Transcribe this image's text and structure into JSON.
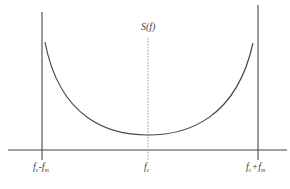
{
  "diagram": {
    "title_label": "S(f)",
    "axis_labels": {
      "left": {
        "base": "f",
        "sub1": "c",
        "op": "-",
        "base2": "f",
        "sub2": "m"
      },
      "center": {
        "base": "f",
        "sub": "c"
      },
      "right": {
        "base": "f",
        "sub1": "c",
        "op": "+",
        "base2": "f",
        "sub2": "m"
      }
    },
    "colors": {
      "line": "#444444",
      "curve": "#4a4a4a",
      "dotted": "#999999",
      "background": "#ffffff"
    }
  }
}
